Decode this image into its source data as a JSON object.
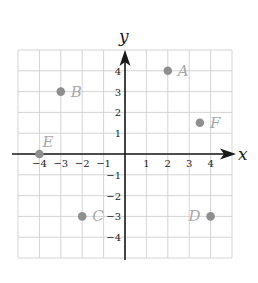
{
  "chart_data": {
    "type": "scatter",
    "title": "",
    "xlabel": "x",
    "ylabel": "y",
    "xlim": [
      -5,
      5
    ],
    "ylim": [
      -5,
      5
    ],
    "grid": true,
    "legend": null,
    "x_ticks": [
      -4,
      -3,
      -2,
      -1,
      1,
      2,
      3,
      4
    ],
    "y_ticks": [
      4,
      3,
      2,
      1,
      -1,
      -2,
      -3,
      -4
    ],
    "x_tick_labels": [
      "−4",
      "−3",
      "−2",
      "−1",
      "1",
      "2",
      "3",
      "4"
    ],
    "y_tick_labels": [
      "4",
      "3",
      "2",
      "1",
      "−1",
      "−2",
      "−3",
      "−4"
    ],
    "points": [
      {
        "label": "A",
        "x": 2,
        "y": 4,
        "label_pos": "right"
      },
      {
        "label": "B",
        "x": -3,
        "y": 3,
        "label_pos": "right"
      },
      {
        "label": "C",
        "x": -2,
        "y": -3,
        "label_pos": "right"
      },
      {
        "label": "D",
        "x": 4,
        "y": -3,
        "label_pos": "left"
      },
      {
        "label": "E",
        "x": -4,
        "y": 0,
        "label_pos": "above"
      },
      {
        "label": "F",
        "x": 3.5,
        "y": 1.5,
        "label_pos": "right"
      }
    ]
  },
  "colors": {
    "grid": "#cfcfcf",
    "axis": "#1a1a1a",
    "point": "#8f8f8f",
    "point_label": "#a8a8a8"
  }
}
